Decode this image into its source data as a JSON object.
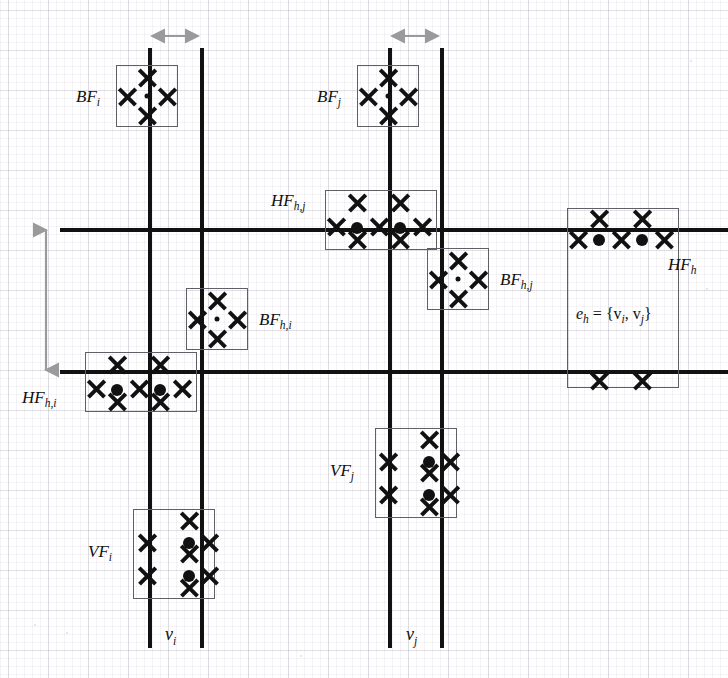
{
  "figure": {
    "type": "diagram",
    "background": "graph-paper",
    "colors": {
      "line": "#111111",
      "box_border": "#5f5f66",
      "arrow": "#9a9a9a",
      "grid": "#b0aab8"
    }
  },
  "labels": {
    "bf_i": {
      "main": "BF",
      "sub": "i"
    },
    "bf_j": {
      "main": "BF",
      "sub": "j"
    },
    "bf_hi": {
      "main": "BF",
      "sub": "h,i"
    },
    "bf_hj": {
      "main": "BF",
      "sub": "h,j"
    },
    "hf_hi": {
      "main": "HF",
      "sub": "h,i"
    },
    "hf_hj": {
      "main": "HF",
      "sub": "h,j"
    },
    "hf_h": {
      "main": "HF",
      "sub": "h"
    },
    "vf_i": {
      "main": "VF",
      "sub": "i"
    },
    "vf_j": {
      "main": "VF",
      "sub": "j"
    },
    "v_i": {
      "main": "v",
      "sub": "i"
    },
    "v_j": {
      "main": "v",
      "sub": "j"
    },
    "edge": {
      "text": "e",
      "sub": "h",
      "rest": " = {v",
      "sub2": "i",
      "rest2": ", v",
      "sub3": "j",
      "rest3": "}"
    }
  },
  "edge_label_full": "e_h = {v_i, v_j}",
  "structure": {
    "vertical_lines_x": [
      148,
      200,
      388,
      440
    ],
    "horizontal_lines_y": [
      228,
      370
    ],
    "vertex_labels": [
      "v_i",
      "v_j"
    ]
  },
  "arrows": [
    {
      "name": "horizontal-gap-arrow-left",
      "orientation": "horizontal",
      "from": 150,
      "to": 200,
      "at": 36
    },
    {
      "name": "horizontal-gap-arrow-right",
      "orientation": "horizontal",
      "from": 390,
      "to": 440,
      "at": 36
    },
    {
      "name": "vertical-gap-arrow",
      "orientation": "vertical",
      "from": 228,
      "to": 370,
      "at": 45
    }
  ],
  "boxes": [
    {
      "name": "bf-i-box",
      "label": "bf_i",
      "x": 116,
      "y": 65,
      "w": 62,
      "h": 62,
      "pattern": "diamond"
    },
    {
      "name": "bf-j-box",
      "label": "bf_j",
      "x": 357,
      "y": 65,
      "w": 62,
      "h": 62,
      "pattern": "diamond"
    },
    {
      "name": "hf-hj-box",
      "label": "hf_hj",
      "x": 325,
      "y": 190,
      "w": 112,
      "h": 60,
      "pattern": "horizontal-strip"
    },
    {
      "name": "bf-hj-box",
      "label": "bf_hj",
      "x": 427,
      "y": 248,
      "w": 62,
      "h": 62,
      "pattern": "diamond"
    },
    {
      "name": "hf-h-box",
      "label": "hf_h",
      "x": 567,
      "y": 208,
      "w": 112,
      "h": 180,
      "pattern": "tall-edge"
    },
    {
      "name": "bf-hi-box",
      "label": "bf_hi",
      "x": 186,
      "y": 288,
      "w": 62,
      "h": 62,
      "pattern": "diamond"
    },
    {
      "name": "hf-hi-box",
      "label": "hf_hi",
      "x": 85,
      "y": 352,
      "w": 112,
      "h": 60,
      "pattern": "horizontal-strip"
    },
    {
      "name": "vf-j-box",
      "label": "vf_j",
      "x": 375,
      "y": 428,
      "w": 82,
      "h": 90,
      "pattern": "vertical-strip"
    },
    {
      "name": "vf-i-box",
      "label": "vf_i",
      "x": 133,
      "y": 509,
      "w": 82,
      "h": 90,
      "pattern": "vertical-strip"
    }
  ],
  "glyph_counts": {
    "x_marks_total": 52,
    "dots_total": 14
  }
}
